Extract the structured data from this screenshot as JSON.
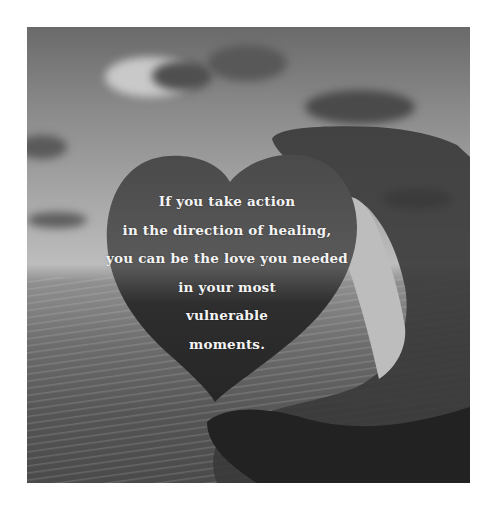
{
  "image": {
    "description": "Grayscale photo of a sunset over the sea with a silhouetted hand holding a heart shape; inspirational quote overlaid inside the heart",
    "colors": {
      "page_background": "#ffffff",
      "sky_dark": "#6a6a6a",
      "horizon_light": "#bdbdbd",
      "heart_fill": "#3a3a3a",
      "hand_fill": "#2e2e2e",
      "text": "#f4f4f4"
    }
  },
  "quote": {
    "lines": [
      "If you take action",
      "in the direction of healing,",
      "you can be the love you needed",
      "in your most",
      "vulnerable",
      "moments."
    ]
  }
}
